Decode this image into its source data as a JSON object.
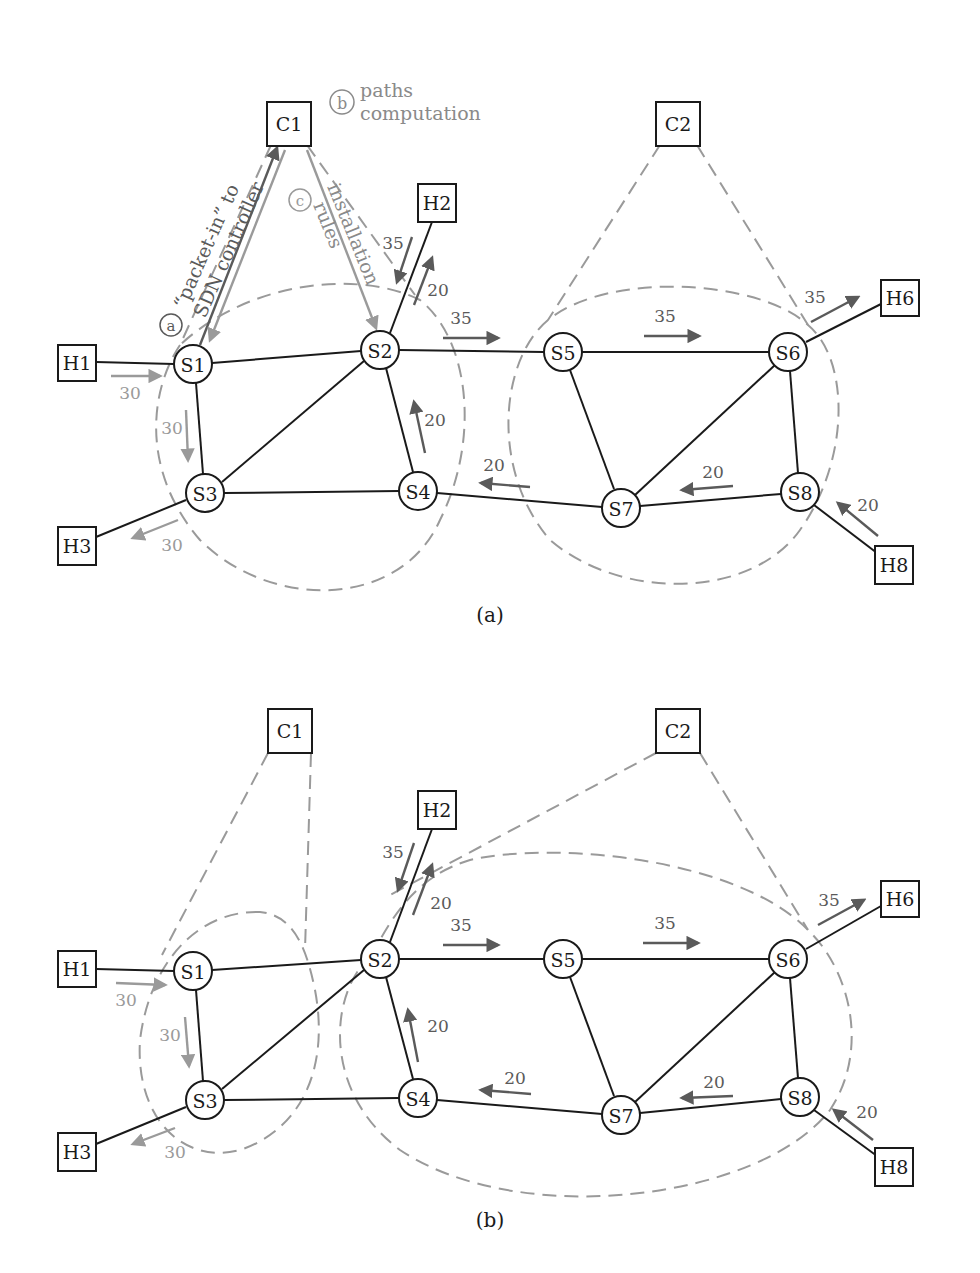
{
  "colors": {
    "dark_arrow": "#5a5a5a",
    "light_arrow": "#9a9a9a",
    "node_stroke": "#1a1a1a"
  },
  "panels": [
    {
      "caption": "(a)",
      "controllers": [
        {
          "id": "C1",
          "label": "C1",
          "x": 289,
          "y": 124
        },
        {
          "id": "C2",
          "label": "C2",
          "x": 679,
          "y": 124
        }
      ],
      "hosts": [
        {
          "id": "H1",
          "label": "H1",
          "x": 77,
          "y": 362
        },
        {
          "id": "H2",
          "label": "H2",
          "x": 435,
          "y": 202
        },
        {
          "id": "H3",
          "label": "H3",
          "x": 77,
          "y": 544
        },
        {
          "id": "H6",
          "label": "H6",
          "x": 899,
          "y": 297
        },
        {
          "id": "H8",
          "label": "H8",
          "x": 893,
          "y": 563
        }
      ],
      "switches": [
        {
          "id": "S1",
          "label": "S1",
          "x": 193,
          "y": 364
        },
        {
          "id": "S2",
          "label": "S2",
          "x": 380,
          "y": 350
        },
        {
          "id": "S3",
          "label": "S3",
          "x": 205,
          "y": 493
        },
        {
          "id": "S4",
          "label": "S4",
          "x": 418,
          "y": 491
        },
        {
          "id": "S5",
          "label": "S5",
          "x": 563,
          "y": 352
        },
        {
          "id": "S6",
          "label": "S6",
          "x": 788,
          "y": 352
        },
        {
          "id": "S7",
          "label": "S7",
          "x": 621,
          "y": 508
        },
        {
          "id": "S8",
          "label": "S8",
          "x": 800,
          "y": 492
        }
      ],
      "flows": [
        {
          "value": "30",
          "tone": "light"
        },
        {
          "value": "30",
          "tone": "light"
        },
        {
          "value": "30",
          "tone": "light"
        },
        {
          "value": "35",
          "tone": "dark"
        },
        {
          "value": "20",
          "tone": "dark"
        },
        {
          "value": "35",
          "tone": "dark"
        },
        {
          "value": "35",
          "tone": "dark"
        },
        {
          "value": "35",
          "tone": "dark"
        },
        {
          "value": "20",
          "tone": "dark"
        },
        {
          "value": "20",
          "tone": "dark"
        },
        {
          "value": "20",
          "tone": "dark"
        },
        {
          "value": "20",
          "tone": "dark"
        }
      ],
      "annotations": {
        "a": {
          "marker": "a",
          "line1": "“packet-in” to",
          "line2": "SDN controller"
        },
        "b": {
          "marker": "b",
          "line1": "paths",
          "line2": "computation"
        },
        "c": {
          "marker": "c",
          "line1": "rules",
          "line2": "installation"
        }
      }
    },
    {
      "caption": "(b)",
      "controllers": [
        {
          "id": "C1",
          "label": "C1",
          "x": 289,
          "y": 731
        },
        {
          "id": "C2",
          "label": "C2",
          "x": 679,
          "y": 731
        }
      ],
      "hosts": [
        {
          "id": "H1",
          "label": "H1",
          "x": 77,
          "y": 969
        },
        {
          "id": "H2",
          "label": "H2",
          "x": 435,
          "y": 809
        },
        {
          "id": "H3",
          "label": "H3",
          "x": 77,
          "y": 1151
        },
        {
          "id": "H6",
          "label": "H6",
          "x": 899,
          "y": 899
        },
        {
          "id": "H8",
          "label": "H8",
          "x": 893,
          "y": 1165
        }
      ],
      "switches": [
        {
          "id": "S1",
          "label": "S1",
          "x": 193,
          "y": 971
        },
        {
          "id": "S2",
          "label": "S2",
          "x": 380,
          "y": 959
        },
        {
          "id": "S3",
          "label": "S3",
          "x": 205,
          "y": 1100
        },
        {
          "id": "S4",
          "label": "S4",
          "x": 418,
          "y": 1098
        },
        {
          "id": "S5",
          "label": "S5",
          "x": 563,
          "y": 959
        },
        {
          "id": "S6",
          "label": "S6",
          "x": 788,
          "y": 959
        },
        {
          "id": "S7",
          "label": "S7",
          "x": 621,
          "y": 1115
        },
        {
          "id": "S8",
          "label": "S8",
          "x": 800,
          "y": 1097
        }
      ],
      "flows": [
        {
          "value": "30",
          "tone": "light"
        },
        {
          "value": "30",
          "tone": "light"
        },
        {
          "value": "30",
          "tone": "light"
        },
        {
          "value": "35",
          "tone": "dark"
        },
        {
          "value": "20",
          "tone": "dark"
        },
        {
          "value": "35",
          "tone": "dark"
        },
        {
          "value": "35",
          "tone": "dark"
        },
        {
          "value": "35",
          "tone": "dark"
        },
        {
          "value": "20",
          "tone": "dark"
        },
        {
          "value": "20",
          "tone": "dark"
        },
        {
          "value": "20",
          "tone": "dark"
        },
        {
          "value": "20",
          "tone": "dark"
        }
      ]
    }
  ]
}
